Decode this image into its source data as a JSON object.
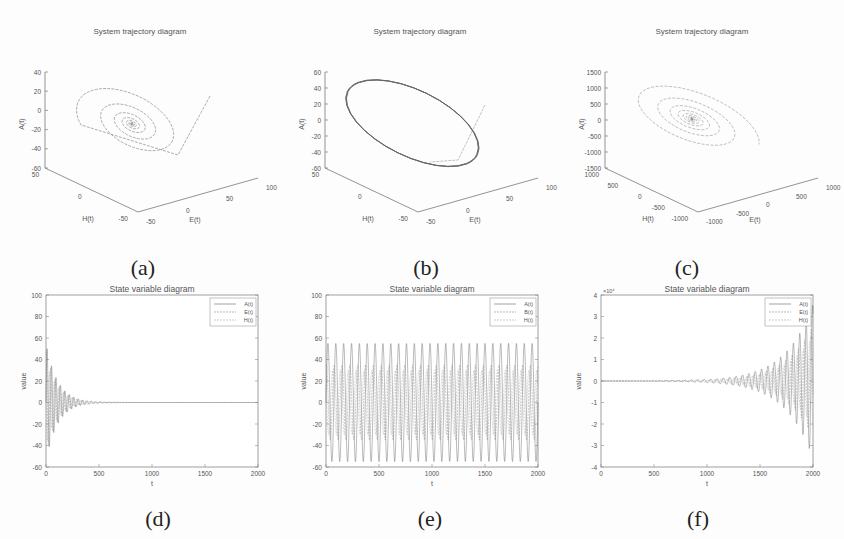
{
  "figure": {
    "captions": [
      "(a)",
      "(b)",
      "(c)",
      "(d)",
      "(e)",
      "(f)"
    ]
  },
  "chart_data": [
    {
      "id": "a",
      "type": "line3d",
      "title": "System trajectory diagram",
      "xlabel": "E(t)",
      "ylabel": "H(t)",
      "zlabel": "A(t)",
      "xticks": [
        "-50",
        "0",
        "50",
        "100"
      ],
      "yticks": [
        "-50",
        "0",
        "50"
      ],
      "zticks": [
        "40",
        "20",
        "0",
        "-20",
        "-40",
        "-60"
      ],
      "xlim": [
        -50,
        100
      ],
      "ylim": [
        -50,
        50
      ],
      "zlim": [
        -60,
        40
      ],
      "description": "Inward spiral converging to a stable focus near origin; starts from line segment entering at upper right",
      "behavior": "converging spiral",
      "grid": false
    },
    {
      "id": "b",
      "type": "line3d",
      "title": "System trajectory diagram",
      "xlabel": "E(t)",
      "ylabel": "H(t)",
      "zlabel": "A(t)",
      "xticks": [
        "-50",
        "0",
        "50",
        "100"
      ],
      "yticks": [
        "-50",
        "0",
        "50"
      ],
      "zticks": [
        "60",
        "40",
        "20",
        "0",
        "-20",
        "-40",
        "-60"
      ],
      "xlim": [
        -50,
        100
      ],
      "ylim": [
        -50,
        50
      ],
      "zlim": [
        -60,
        60
      ],
      "description": "Trajectory settling on a closed elliptical limit cycle",
      "behavior": "limit cycle",
      "grid": false
    },
    {
      "id": "c",
      "type": "line3d",
      "title": "System trajectory diagram",
      "xlabel": "E(t)",
      "ylabel": "H(t)",
      "zlabel": "A(t)",
      "xticks": [
        "-1000",
        "-500",
        "0",
        "500",
        "1000"
      ],
      "yticks": [
        "-1000",
        "-500",
        "0",
        "500",
        "1000"
      ],
      "zticks": [
        "1500",
        "1000",
        "500",
        "0",
        "-500",
        "-1000",
        "-1500"
      ],
      "xlim": [
        -1000,
        1000
      ],
      "ylim": [
        -1000,
        1000
      ],
      "zlim": [
        -1500,
        1500
      ],
      "description": "Outward diverging spiral from the origin",
      "behavior": "diverging spiral",
      "grid": false
    },
    {
      "id": "d",
      "type": "line",
      "title": "State variable diagram",
      "xlabel": "t",
      "ylabel": "value",
      "xticks": [
        "0",
        "500",
        "1000",
        "1500",
        "2000"
      ],
      "yticks": [
        "100",
        "80",
        "60",
        "40",
        "20",
        "0",
        "-20",
        "-40",
        "-60"
      ],
      "xlim": [
        0,
        2000
      ],
      "ylim": [
        -60,
        100
      ],
      "legend": [
        "A(t)",
        "E(t)",
        "H(t)"
      ],
      "legend_position": "upper right",
      "series": [
        {
          "name": "A(t)",
          "envelope_start": 55,
          "decay_to_zero_at_t": 600
        },
        {
          "name": "E(t)",
          "envelope_start": 50,
          "decay_to_zero_at_t": 600
        },
        {
          "name": "H(t)",
          "envelope_start": 45,
          "decay_to_zero_at_t": 600
        }
      ],
      "behavior": "damped oscillation decaying to 0",
      "grid": false
    },
    {
      "id": "e",
      "type": "line",
      "title": "State variable diagram",
      "xlabel": "t",
      "ylabel": "value",
      "xticks": [
        "0",
        "500",
        "1000",
        "1500",
        "2000"
      ],
      "yticks": [
        "100",
        "80",
        "60",
        "40",
        "20",
        "0",
        "-20",
        "-40",
        "-60"
      ],
      "xlim": [
        0,
        2000
      ],
      "ylim": [
        -60,
        100
      ],
      "legend": [
        "A(t)",
        "B(t)",
        "H(t)"
      ],
      "legend_position": "upper right",
      "series": [
        {
          "name": "A(t)",
          "max": 55,
          "min": -55,
          "periods": 27
        },
        {
          "name": "B(t)",
          "max": 35,
          "min": -35,
          "periods": 27
        },
        {
          "name": "H(t)",
          "max": 30,
          "min": -30,
          "periods": 27
        }
      ],
      "behavior": "sustained periodic oscillation",
      "grid": false
    },
    {
      "id": "f",
      "type": "line",
      "title": "State variable diagram",
      "xlabel": "t",
      "ylabel": "value",
      "y_multiplier": "×10⁴",
      "xticks": [
        "0",
        "500",
        "1000",
        "1500",
        "2000"
      ],
      "yticks": [
        "4",
        "3",
        "2",
        "1",
        "0",
        "-1",
        "-2",
        "-3",
        "-4"
      ],
      "xlim": [
        0,
        2000
      ],
      "ylim": [
        -4,
        4
      ],
      "legend": [
        "A(t)",
        "E(t)",
        "H(t)"
      ],
      "legend_position": "upper right",
      "series": [
        {
          "name": "A(t)",
          "envelope_end": 3.5,
          "growth_starts_t": 700
        },
        {
          "name": "E(t)",
          "envelope_end": 2.5,
          "growth_starts_t": 700
        },
        {
          "name": "H(t)",
          "envelope_end": 2.0,
          "growth_starts_t": 700
        }
      ],
      "behavior": "growing oscillation (divergent)",
      "grid": false
    }
  ]
}
